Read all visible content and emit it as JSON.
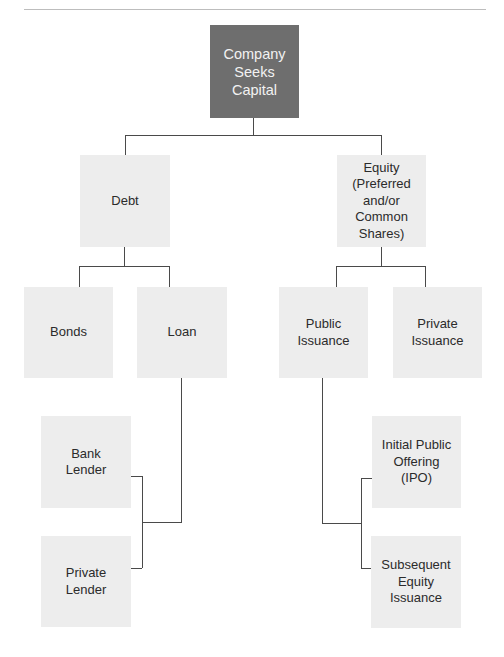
{
  "diagram": {
    "title": "Company Seeks Capital",
    "nodes": {
      "root": {
        "label": "Company\nSeeks\nCapital"
      },
      "debt": {
        "label": "Debt"
      },
      "equity": {
        "label": "Equity\n(Preferred\nand/or\nCommon\nShares)"
      },
      "bonds": {
        "label": "Bonds"
      },
      "loan": {
        "label": "Loan"
      },
      "public_issuance": {
        "label": "Public\nIssuance"
      },
      "private_issuance": {
        "label": "Private\nIssuance"
      },
      "bank_lender": {
        "label": "Bank\nLender"
      },
      "private_lender": {
        "label": "Private\nLender"
      },
      "ipo": {
        "label": "Initial Public\nOffering\n(IPO)"
      },
      "subsequent_equity": {
        "label": "Subsequent\nEquity\nIssuance"
      }
    },
    "edges": [
      [
        "root",
        "debt"
      ],
      [
        "root",
        "equity"
      ],
      [
        "debt",
        "bonds"
      ],
      [
        "debt",
        "loan"
      ],
      [
        "equity",
        "public_issuance"
      ],
      [
        "equity",
        "private_issuance"
      ],
      [
        "loan",
        "bank_lender"
      ],
      [
        "loan",
        "private_lender"
      ],
      [
        "public_issuance",
        "ipo"
      ],
      [
        "public_issuance",
        "subsequent_equity"
      ]
    ],
    "colors": {
      "root_fill": "#6e6e6e",
      "node_fill": "#ededed",
      "line": "#4a4a4a"
    }
  }
}
